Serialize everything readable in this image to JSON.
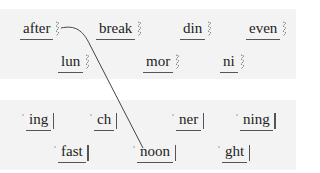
{
  "panels": [
    {
      "name": "first-parts",
      "tiles": [
        {
          "text": "after",
          "x": 20,
          "y": 19
        },
        {
          "text": "break",
          "x": 96,
          "y": 19
        },
        {
          "text": "din",
          "x": 180,
          "y": 19
        },
        {
          "text": "even",
          "x": 246,
          "y": 19
        },
        {
          "text": "lun",
          "x": 58,
          "y": 52
        },
        {
          "text": "mor",
          "x": 143,
          "y": 52
        },
        {
          "text": "ni",
          "x": 220,
          "y": 52
        }
      ]
    },
    {
      "name": "second-parts",
      "tiles": [
        {
          "text": "ing",
          "x": 26,
          "y": 110
        },
        {
          "text": "ch",
          "x": 94,
          "y": 110
        },
        {
          "text": "ner",
          "x": 176,
          "y": 110
        },
        {
          "text": "ning",
          "x": 240,
          "y": 110
        },
        {
          "text": "fast",
          "x": 58,
          "y": 142
        },
        {
          "text": "noon",
          "x": 137,
          "y": 142
        },
        {
          "text": "ght",
          "x": 222,
          "y": 142
        }
      ]
    }
  ],
  "connection": {
    "from": "after",
    "to": "noon"
  }
}
